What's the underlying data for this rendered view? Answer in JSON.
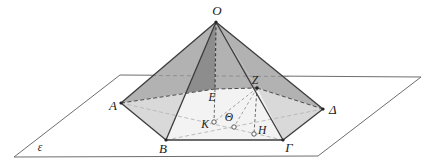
{
  "figure": {
    "type": "geometry-diagram"
  },
  "labels": {
    "apex": "O",
    "vertex_a": "A",
    "vertex_b": "B",
    "vertex_gamma": "Γ",
    "vertex_delta": "Δ",
    "vertex_e": "E",
    "point_z": "Z",
    "foot_k": "K",
    "foot_theta": "Θ",
    "foot_h": "H",
    "plane": "ε"
  },
  "colors": {
    "background": "#ffffff",
    "plane_fill": "#ffffff",
    "face_medium": "#b2b2b2",
    "face_dark": "#8d8d8d",
    "face_light": "#d9d9d9",
    "base_interior": "#f3f3f3",
    "edge": "#3c3c3c",
    "plane_edge": "#6e6e6e",
    "auxiliary": "#9a9a9a"
  }
}
